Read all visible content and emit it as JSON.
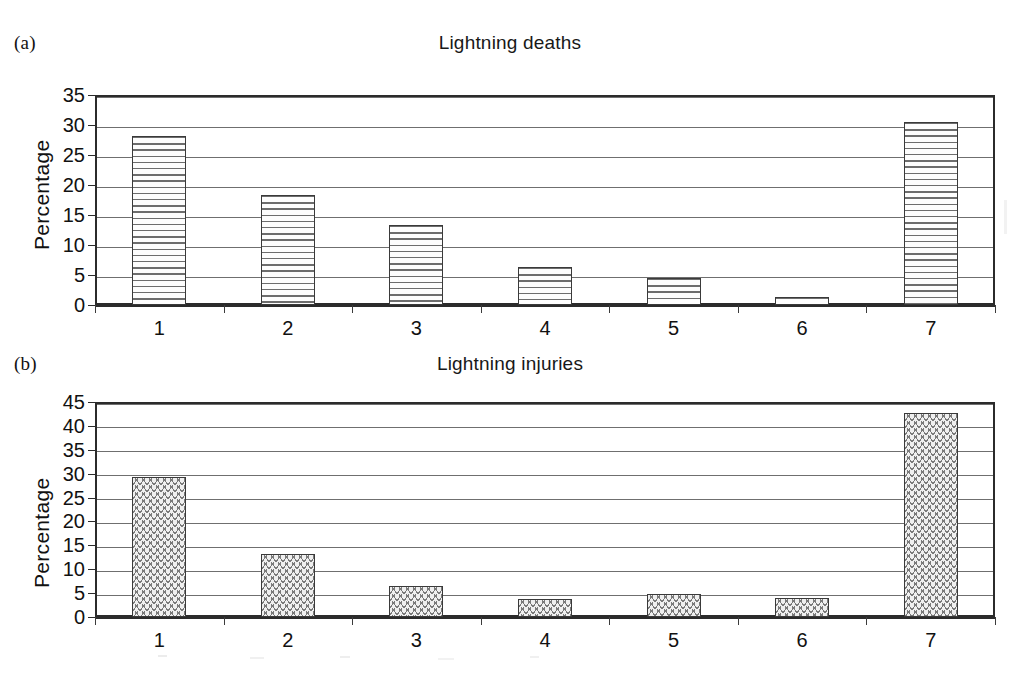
{
  "figure": {
    "background_color": "#ffffff",
    "ink_color": "#1a1a1a",
    "grid_color": "#6f6f6f"
  },
  "panels": [
    {
      "letter": "(a)",
      "title": "Lightning deaths",
      "ylabel": "Percentage"
    },
    {
      "letter": "(b)",
      "title": "Lightning injuries",
      "ylabel": "Percentage"
    }
  ],
  "chart_data": [
    {
      "type": "bar",
      "title": "Lightning deaths",
      "panel": "(a)",
      "xlabel": "",
      "ylabel": "Percentage",
      "categories": [
        "1",
        "2",
        "3",
        "4",
        "5",
        "6",
        "7"
      ],
      "values": [
        28.2,
        18.3,
        13.3,
        6.3,
        4.5,
        1.3,
        30.5
      ],
      "ylim": [
        0,
        35
      ],
      "yticks": [
        0,
        5,
        10,
        15,
        20,
        25,
        30,
        35
      ],
      "grid": true,
      "legend": false,
      "bar_pattern": "horizontal-lines"
    },
    {
      "type": "bar",
      "title": "Lightning injuries",
      "panel": "(b)",
      "xlabel": "",
      "ylabel": "Percentage",
      "categories": [
        "1",
        "2",
        "3",
        "4",
        "5",
        "6",
        "7"
      ],
      "values": [
        29.2,
        13.2,
        6.5,
        3.7,
        4.8,
        4.0,
        42.6
      ],
      "ylim": [
        0,
        45
      ],
      "yticks": [
        0,
        5,
        10,
        15,
        20,
        25,
        30,
        35,
        40,
        45
      ],
      "grid": true,
      "legend": false,
      "bar_pattern": "zigzag-wave"
    }
  ]
}
